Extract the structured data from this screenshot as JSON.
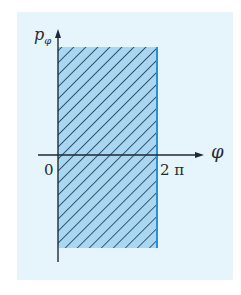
{
  "figure": {
    "type": "phase-space-region",
    "axes": {
      "vertical_label": "p",
      "vertical_label_subscript": "φ",
      "horizontal_label": "φ"
    },
    "ticks": {
      "origin": "0",
      "right_bound": "2 π"
    },
    "region": {
      "description": "hatched strip 0 ≤ φ ≤ 2π, extending in p_φ",
      "fill_color": "#a9d6f0",
      "hatch_color": "#1c3752",
      "boundary_color": "#2b8fd6"
    },
    "colors": {
      "background_panel": "#e6f5fb",
      "axis": "#1e2a36"
    }
  }
}
